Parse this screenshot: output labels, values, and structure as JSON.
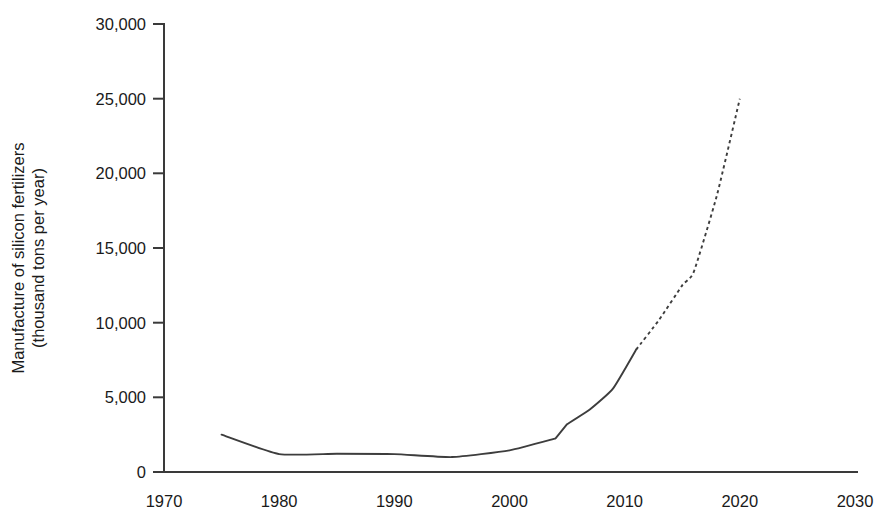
{
  "chart_data": {
    "type": "line",
    "title": "",
    "subtitle": "",
    "xlabel": "",
    "ylabel": "Manufacture of silicon fertilizers (thousand tons per year)",
    "ylabel_line1": "Manufacture of silicon fertilizers",
    "ylabel_line2": "(thousand tons per year)",
    "xlim": [
      1970,
      2030
    ],
    "ylim": [
      0,
      30000
    ],
    "grid": false,
    "legend": null,
    "legend_position": "none",
    "x_ticks": [
      1970,
      1980,
      1990,
      2000,
      2010,
      2020,
      2030
    ],
    "x_tick_labels": [
      "1970",
      "1980",
      "1990",
      "2000",
      "2010",
      "2020",
      "2030"
    ],
    "y_ticks": [
      0,
      5000,
      10000,
      15000,
      20000,
      25000,
      30000
    ],
    "y_tick_labels": [
      "0",
      "5,000",
      "10,000",
      "15,000",
      "20,000",
      "25,000",
      "30,000"
    ],
    "series": [
      {
        "name": "Historical (observed)",
        "style": "solid",
        "color": "#3d3d3d",
        "x": [
          1975,
          1980,
          1985,
          1990,
          1995,
          2000,
          2004,
          2005,
          2007,
          2009,
          2011
        ],
        "values": [
          2500,
          1200,
          1220,
          1200,
          1000,
          1450,
          2250,
          3200,
          4200,
          5600,
          8200
        ]
      },
      {
        "name": "Forecast (projected)",
        "style": "dashed",
        "color": "#3d3d3d",
        "x": [
          2011,
          2013,
          2015,
          2016,
          2018,
          2020
        ],
        "values": [
          8200,
          10200,
          12500,
          13400,
          18500,
          25000
        ]
      }
    ],
    "annotations": [
      {
        "text": "step increase at 2005",
        "x": 2005,
        "y": 3200
      }
    ]
  },
  "axes": {
    "y_axis_name": "value-axis",
    "x_axis_name": "year-axis"
  }
}
